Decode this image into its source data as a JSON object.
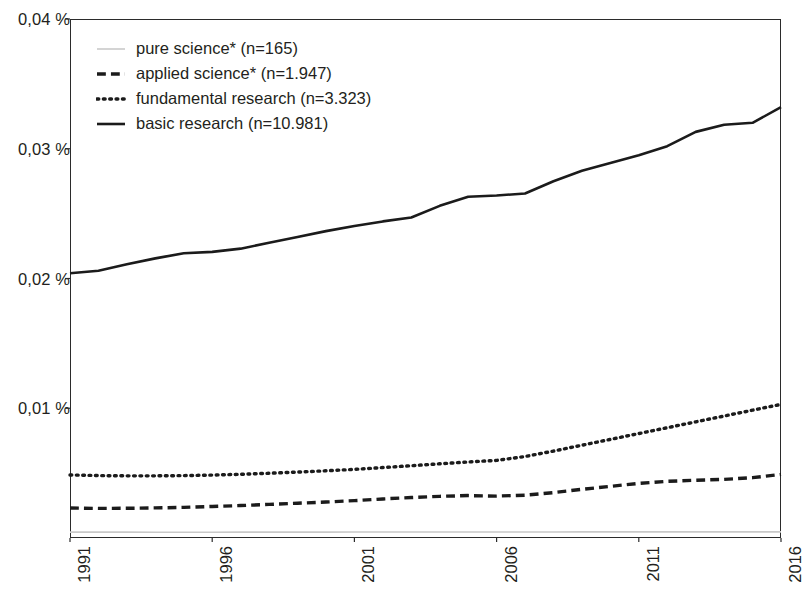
{
  "chart_data": {
    "type": "line",
    "title": "",
    "subtitle": "",
    "xlabel": "",
    "ylabel": "",
    "x": [
      1991,
      1992,
      1993,
      1994,
      1995,
      1996,
      1997,
      1998,
      1999,
      2000,
      2001,
      2002,
      2003,
      2004,
      2005,
      2006,
      2007,
      2008,
      2009,
      2010,
      2011,
      2012,
      2013,
      2014,
      2015,
      2016
    ],
    "xlim": [
      1991,
      2016
    ],
    "ylim": [
      0,
      0.04
    ],
    "y_unit": "%",
    "grid": false,
    "legend_position": "top-left",
    "x_tick_labels": [
      "1991",
      "1996",
      "2001",
      "2006",
      "2011",
      "2016"
    ],
    "x_tick_values": [
      1991,
      1996,
      2001,
      2006,
      2011,
      2016
    ],
    "y_tick_labels": [
      "0,01 %",
      "0,02 %",
      "0,03 %",
      "0,04 %"
    ],
    "y_tick_values": [
      0.01,
      0.02,
      0.03,
      0.04
    ],
    "series": [
      {
        "name": "pure science* (n=165)",
        "key": "pure-science",
        "style": "solid",
        "color": "#c9c9c9",
        "width": 1.6,
        "values": [
          0.00045,
          0.00045,
          0.00045,
          0.00044,
          0.00044,
          0.00044,
          0.00045,
          0.00045,
          0.00045,
          0.00045,
          0.00046,
          0.00046,
          0.00046,
          0.00046,
          0.00046,
          0.00046,
          0.00046,
          0.00046,
          0.00047,
          0.00047,
          0.00047,
          0.00047,
          0.00047,
          0.00047,
          0.00047,
          0.00047
        ]
      },
      {
        "name": "applied science* (n=1.947)",
        "key": "applied-science",
        "style": "dashed",
        "color": "#1b1b1b",
        "width": 3.4,
        "values": [
          0.00231,
          0.00228,
          0.00229,
          0.00232,
          0.00236,
          0.00243,
          0.0025,
          0.00259,
          0.00268,
          0.00277,
          0.00288,
          0.00301,
          0.00312,
          0.00321,
          0.00327,
          0.00323,
          0.0033,
          0.0035,
          0.00375,
          0.00398,
          0.00421,
          0.00437,
          0.00445,
          0.00452,
          0.00465,
          0.0049
        ]
      },
      {
        "name": "fundamental research (n=3.323)",
        "key": "fundamental-research",
        "style": "dotted",
        "color": "#1b1b1b",
        "width": 3.4,
        "values": [
          0.00486,
          0.00481,
          0.00479,
          0.00479,
          0.00481,
          0.00485,
          0.00491,
          0.00499,
          0.00508,
          0.00518,
          0.00529,
          0.00543,
          0.00557,
          0.00572,
          0.00586,
          0.00598,
          0.00628,
          0.0067,
          0.00715,
          0.0076,
          0.00805,
          0.0085,
          0.00895,
          0.0094,
          0.00985,
          0.0103
        ]
      },
      {
        "name": "basic research (n=10.981)",
        "key": "basic-research",
        "style": "solid",
        "color": "#1b1b1b",
        "width": 2.6,
        "values": [
          0.0204,
          0.0206,
          0.0211,
          0.02155,
          0.02195,
          0.02205,
          0.0223,
          0.02275,
          0.0232,
          0.02365,
          0.02405,
          0.0244,
          0.0247,
          0.0256,
          0.0263,
          0.0264,
          0.02655,
          0.0275,
          0.0283,
          0.0289,
          0.0295,
          0.0302,
          0.0313,
          0.03185,
          0.032,
          0.0332
        ]
      }
    ]
  },
  "legend": {
    "items": [
      {
        "label": "pure science* (n=165)",
        "key": "pure-science"
      },
      {
        "label": "applied science* (n=1.947)",
        "key": "applied-science"
      },
      {
        "label": "fundamental research (n=3.323)",
        "key": "fundamental-research"
      },
      {
        "label": "basic research (n=10.981)",
        "key": "basic-research"
      }
    ]
  },
  "axes": {
    "y_ticks": [
      {
        "label": "0,04 %",
        "value": 0.04
      },
      {
        "label": "0,03 %",
        "value": 0.03
      },
      {
        "label": "0,02 %",
        "value": 0.02
      },
      {
        "label": "0,01 %",
        "value": 0.01
      }
    ],
    "x_ticks": [
      {
        "label": "1991",
        "value": 1991
      },
      {
        "label": "1996",
        "value": 1996
      },
      {
        "label": "2001",
        "value": 2001
      },
      {
        "label": "2006",
        "value": 2006
      },
      {
        "label": "2011",
        "value": 2011
      },
      {
        "label": "2016",
        "value": 2016
      }
    ]
  }
}
